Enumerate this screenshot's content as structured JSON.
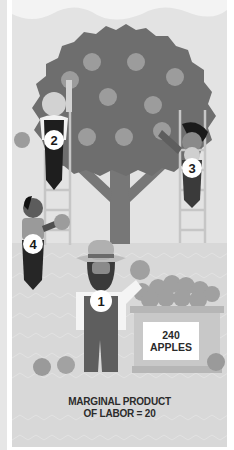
{
  "illustration": {
    "title": "Marginal product of labor – apple orchard",
    "workers": [
      {
        "number": "1",
        "role": "farmer carrying apples to crate"
      },
      {
        "number": "2",
        "role": "picker on left ladder"
      },
      {
        "number": "3",
        "role": "picker on right ladder"
      },
      {
        "number": "4",
        "role": "picker on ground"
      }
    ],
    "crate": {
      "count": "240",
      "unit": "APPLES"
    },
    "caption": {
      "line1": "MARGINAL PRODUCT",
      "line2": "OF LABOR = 20"
    },
    "icons": [
      "apple-tree-icon",
      "apple-icon",
      "ladder-icon",
      "crate-icon",
      "worker-icon"
    ],
    "colors": {
      "sky": "#e3e3e3",
      "canopy": "#6e6e6e",
      "apple": "#9c9c9c",
      "trunk": "#7a7a7a",
      "ground": "#d9d9d9",
      "overalls": "#5a5a5a",
      "badge": "#ffffff",
      "text": "#2b2b2b"
    }
  }
}
